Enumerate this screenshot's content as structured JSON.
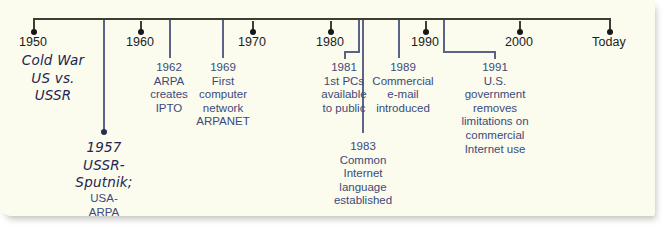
{
  "figure": {
    "kind": "internet-history-timeline",
    "background_color": "#fbfbee",
    "axis_color": "#403d33",
    "connector_color": "#5b6486",
    "event_text_color": "#3b4a7a",
    "handwriting_color": "#232550"
  },
  "axis": {
    "ticks": [
      {
        "label": "1950",
        "x": 33
      },
      {
        "label": "1960",
        "x": 140
      },
      {
        "label": "1970",
        "x": 252
      },
      {
        "label": "1980",
        "x": 330
      },
      {
        "label": "1990",
        "x": 425
      },
      {
        "label": "2000",
        "x": 519
      },
      {
        "label": "Today",
        "x": 609
      }
    ]
  },
  "events": [
    {
      "id": "cold-war",
      "style": "handwritten",
      "year": "",
      "text": "Cold War\nUS vs.\nUSSR"
    },
    {
      "id": "sputnik",
      "style": "handwritten",
      "year": "1957",
      "text": "1957\nUSSR-\nSputnik;"
    },
    {
      "id": "sputnik-sub",
      "style": "plain",
      "year": "",
      "text": "USA-\nARPA"
    },
    {
      "id": "arpa-ipto",
      "style": "plain",
      "year": "1962",
      "text": "1962\nARPA\ncreates\nIPTO"
    },
    {
      "id": "arpanet",
      "style": "plain",
      "year": "1969",
      "text": "1969\nFirst\ncomputer\nnetwork\nARPANET"
    },
    {
      "id": "first-pcs",
      "style": "plain",
      "year": "1981",
      "text": "1981\n1st PCs\navailable\nto public"
    },
    {
      "id": "common-language",
      "style": "plain",
      "year": "1983",
      "text": "1983\nCommon\nInternet\nlanguage\nestablished"
    },
    {
      "id": "commercial-email",
      "style": "plain",
      "year": "1989",
      "text": "1989\nCommercial\ne-mail\nintroduced"
    },
    {
      "id": "us-gov-removes-limits",
      "style": "plain",
      "year": "1991",
      "text": "1991\nU.S.\ngovernment\nremoves\nlimitations on\ncommercial\nInternet use"
    }
  ]
}
